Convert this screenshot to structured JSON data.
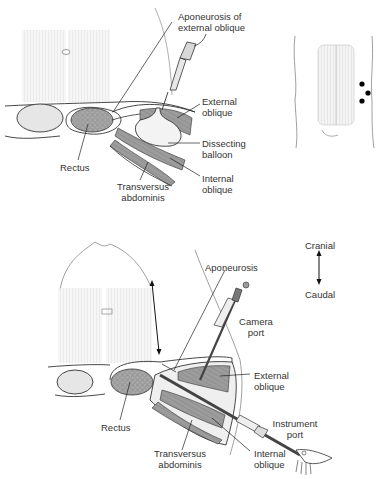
{
  "top_panel": {
    "labels": {
      "aponeurosis": [
        "Aponeurosis of",
        "external oblique"
      ],
      "external_oblique": [
        "External",
        "oblique"
      ],
      "dissecting_balloon": [
        "Dissecting",
        "balloon"
      ],
      "internal_oblique": [
        "Internal",
        "oblique"
      ],
      "rectus": "Rectus",
      "transversus": [
        "Transversus",
        "abdominis"
      ]
    },
    "inset": {
      "port_markers": 3,
      "marker_color": "#000000"
    }
  },
  "bottom_panel": {
    "labels": {
      "aponeurosis": "Aponeurosis",
      "camera_port": [
        "Camera",
        "port"
      ],
      "external_oblique": [
        "External",
        "oblique"
      ],
      "instrument_port": [
        "Instrument",
        "port"
      ],
      "internal_oblique": [
        "Internal",
        "oblique"
      ],
      "rectus": "Rectus",
      "transversus": [
        "Transversus",
        "abdominis"
      ]
    },
    "orientation": {
      "top": "Cranial",
      "bottom": "Caudal"
    }
  },
  "colors": {
    "line": "#333333",
    "muscle_fill": "#9a9a9a",
    "light_fill": "#e4e4e4",
    "balloon_fill": "#f2f2f2"
  }
}
